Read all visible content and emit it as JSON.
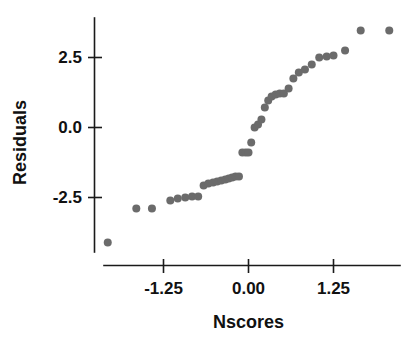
{
  "figure": {
    "background_color": "#ffffff",
    "axis_color": "#1a1a1a",
    "point_color": "#6b6b6b",
    "point_radius": 4.0
  },
  "labels": {
    "xlabel": "Nscores",
    "ylabel": "Residuals",
    "xticks": [
      "-1.25",
      "0.00",
      "1.25"
    ],
    "yticks": [
      "2.5",
      "0.0",
      "-2.5"
    ]
  },
  "chart_data": {
    "type": "scatter",
    "title": "",
    "xlabel": "Nscores",
    "ylabel": "Residuals",
    "xlim": [
      -2.35,
      2.35
    ],
    "ylim": [
      -4.55,
      4.45
    ],
    "xticks": [
      -1.25,
      0.0,
      1.25
    ],
    "xtick_labels": [
      "-1.25",
      "0.00",
      "1.25"
    ],
    "yticks": [
      2.5,
      0.0,
      -2.5
    ],
    "ytick_labels": [
      "2.5",
      "0.0",
      "-2.5"
    ],
    "grid": false,
    "legend": null,
    "series": [
      {
        "name": "Residuals vs Nscores",
        "color": "#6b6b6b",
        "marker": "circle",
        "x": [
          -2.07,
          -1.65,
          -1.42,
          -1.15,
          -1.04,
          -0.93,
          -0.83,
          -0.74,
          -0.66,
          -0.59,
          -0.52,
          -0.46,
          -0.4,
          -0.34,
          -0.29,
          -0.24,
          -0.19,
          -0.14,
          -0.09,
          -0.04,
          0.0,
          0.04,
          0.09,
          0.14,
          0.19,
          0.24,
          0.29,
          0.34,
          0.4,
          0.46,
          0.52,
          0.59,
          0.66,
          0.74,
          0.83,
          0.93,
          1.04,
          1.15,
          1.25,
          1.42,
          1.65,
          2.07
        ],
        "y": [
          -4.11,
          -2.89,
          -2.89,
          -2.61,
          -2.54,
          -2.5,
          -2.46,
          -2.46,
          -2.07,
          -2.0,
          -1.96,
          -1.93,
          -1.89,
          -1.86,
          -1.82,
          -1.79,
          -1.75,
          -1.75,
          -0.89,
          -0.89,
          -0.89,
          -0.54,
          0.0,
          0.11,
          0.29,
          0.71,
          0.96,
          1.11,
          1.18,
          1.21,
          1.21,
          1.39,
          1.75,
          1.96,
          2.07,
          2.25,
          2.5,
          2.54,
          2.57,
          2.75,
          3.46,
          3.46
        ],
        "n_points": 44
      }
    ]
  }
}
